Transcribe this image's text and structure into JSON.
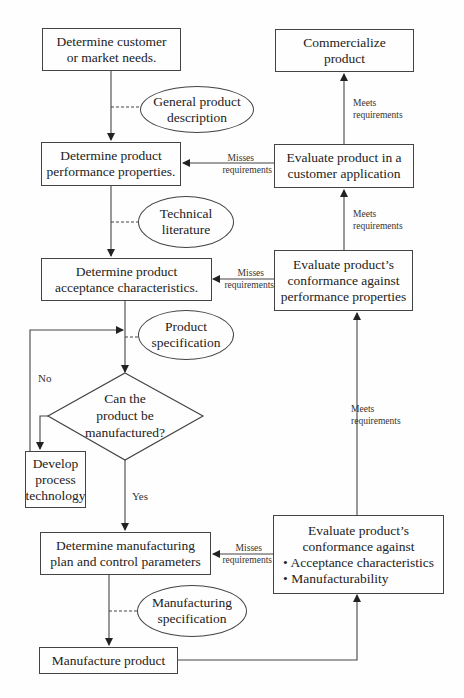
{
  "diagram": {
    "type": "flowchart",
    "nodes": {
      "customer_needs": {
        "lines": [
          "Determine customer",
          "or market needs."
        ]
      },
      "general_desc": {
        "lines": [
          "General product",
          "description"
        ]
      },
      "performance_props": {
        "lines": [
          "Determine product",
          "performance properties."
        ]
      },
      "technical_lit": {
        "lines": [
          "Technical",
          "literature"
        ]
      },
      "acceptance_chars": {
        "lines": [
          "Determine product",
          "acceptance characteristics."
        ]
      },
      "product_spec": {
        "lines": [
          "Product",
          "specification"
        ]
      },
      "can_manufacture": {
        "lines": [
          "Can the",
          "product be",
          "manufactured?"
        ]
      },
      "develop_process": {
        "lines": [
          "Develop",
          "process",
          "technology"
        ]
      },
      "mfg_plan": {
        "lines": [
          "Determine manufacturing",
          "plan and control parameters"
        ]
      },
      "mfg_spec": {
        "lines": [
          "Manufacturing",
          "specification"
        ]
      },
      "manufacture": {
        "lines": [
          "Manufacture product"
        ]
      },
      "eval_mfg": {
        "lines": [
          "Evaluate product’s",
          "conformance against"
        ],
        "bullets": [
          "• Acceptance characteristics",
          "• Manufacturability"
        ]
      },
      "eval_perf": {
        "lines": [
          "Evaluate product’s",
          "conformance against",
          "performance properties"
        ]
      },
      "eval_customer": {
        "lines": [
          "Evaluate product in a",
          "customer application"
        ]
      },
      "commercialize": {
        "lines": [
          "Commercialize",
          "product"
        ]
      }
    },
    "edge_labels": {
      "no": "No",
      "yes": "Yes",
      "meets_1": [
        "Meets",
        "requirements"
      ],
      "meets_2": [
        "Meets",
        "requirements"
      ],
      "meets_3": [
        "Meets",
        "requirements"
      ],
      "misses_1": [
        "Misses",
        "requirements"
      ],
      "misses_2": [
        "Misses",
        "requirements"
      ],
      "misses_3": [
        "Misses",
        "requirements"
      ]
    }
  }
}
